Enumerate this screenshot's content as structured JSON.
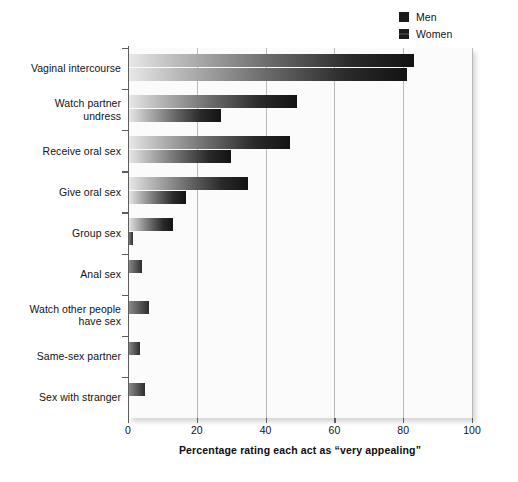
{
  "chart_data": {
    "type": "bar",
    "orientation": "horizontal",
    "title": "",
    "xlabel": "Percentage rating each act as “very appealing”",
    "ylabel": "",
    "xlim": [
      0,
      100
    ],
    "xticks": [
      0,
      20,
      40,
      60,
      80,
      100
    ],
    "xticklabels": [
      "0",
      "20",
      "40",
      "60",
      "80",
      "100"
    ],
    "grid": "vertical",
    "legend_position": "top-right",
    "categories": [
      "Vaginal intercourse",
      "Watch partner undress",
      "Receive oral sex",
      "Give oral sex",
      "Group sex",
      "Anal sex",
      "Watch other people have sex",
      "Same-sex partner",
      "Sex with stranger"
    ],
    "category_lines": [
      [
        "Vaginal intercourse"
      ],
      [
        "Watch partner",
        "undress"
      ],
      [
        "Receive oral sex"
      ],
      [
        "Give oral sex"
      ],
      [
        "Group sex"
      ],
      [
        "Anal sex"
      ],
      [
        "Watch other people",
        "have sex"
      ],
      [
        "Same-sex partner"
      ],
      [
        "Sex with stranger"
      ]
    ],
    "series": [
      {
        "name": "Men",
        "color": "#131313",
        "values": [
          83,
          49,
          47,
          35,
          13,
          4,
          6,
          3.5,
          5
        ]
      },
      {
        "name": "Women",
        "color": "#131313",
        "values": [
          81,
          27,
          30,
          17,
          1.5,
          0,
          0,
          0,
          0
        ]
      }
    ]
  },
  "legend": {
    "items": [
      {
        "label": "Men",
        "swatch": "men-swatch"
      },
      {
        "label": "Women",
        "swatch": "women-swatch"
      }
    ]
  },
  "colors": {
    "bar_dark": "#131313",
    "bar_light": "#e9e9e9",
    "plot_background": "#fbfbfb",
    "gridline": "#b9b9b9",
    "axis": "#5d5d5d",
    "text": "#131313"
  }
}
